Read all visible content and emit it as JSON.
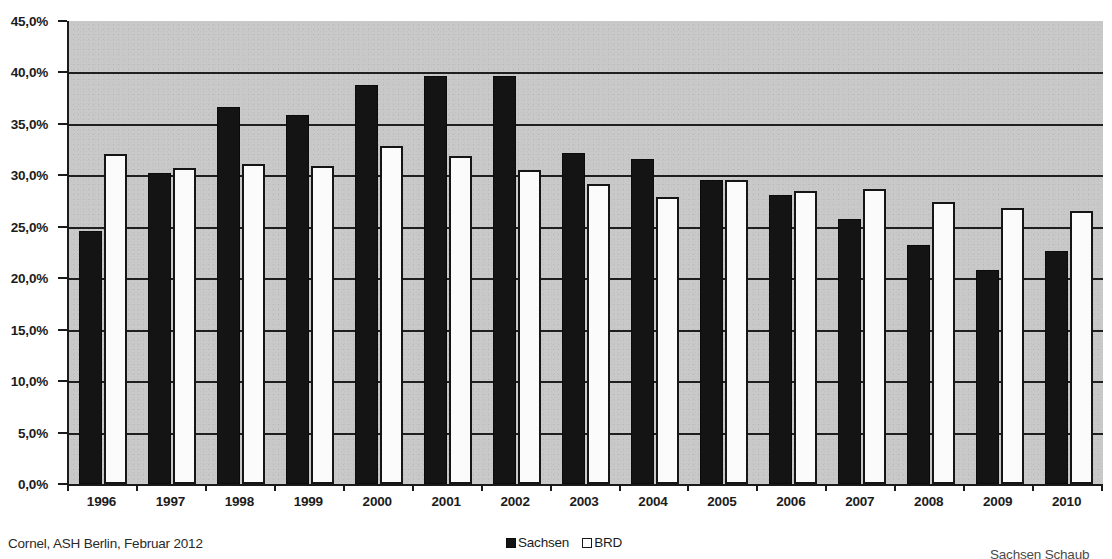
{
  "chart_data": {
    "type": "bar",
    "title": "",
    "xlabel": "",
    "ylabel": "",
    "ylim": [
      0,
      45
    ],
    "grid": true,
    "legend_position": "bottom-center",
    "y_tick_labels": [
      "0,0%",
      "5,0%",
      "10,0%",
      "15,0%",
      "20,0%",
      "25,0%",
      "30,0%",
      "35,0%",
      "40,0%",
      "45,0%"
    ],
    "y_ticks": [
      0,
      5,
      10,
      15,
      20,
      25,
      30,
      35,
      40,
      45
    ],
    "categories": [
      "1996",
      "1997",
      "1998",
      "1999",
      "2000",
      "2001",
      "2002",
      "2003",
      "2004",
      "2005",
      "2006",
      "2007",
      "2008",
      "2009",
      "2010"
    ],
    "series": [
      {
        "name": "Sachsen",
        "color": "#141414",
        "values": [
          24.6,
          30.2,
          36.6,
          35.9,
          38.8,
          39.7,
          39.7,
          32.2,
          31.6,
          29.5,
          28.1,
          25.8,
          23.2,
          20.8,
          22.6
        ]
      },
      {
        "name": "BRD",
        "color": "#ffffff",
        "values": [
          32.1,
          30.7,
          31.1,
          30.9,
          32.9,
          31.9,
          30.5,
          29.2,
          27.9,
          29.5,
          28.5,
          28.7,
          27.4,
          26.8,
          26.5
        ]
      }
    ]
  },
  "legend": {
    "items": [
      {
        "label": "Sachsen",
        "swatch": "filled-black-square"
      },
      {
        "label": "BRD",
        "swatch": "outlined-white-square"
      }
    ]
  },
  "footer": {
    "source": "Cornel, ASH Berlin, Februar 2012",
    "caption": "Sachsen Schaub"
  }
}
